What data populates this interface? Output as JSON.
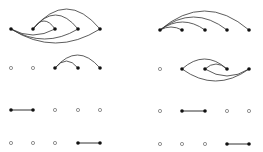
{
  "diagram": {
    "type": "arc-diagram-grid",
    "colors": {
      "edge": "#333333",
      "filled_node": "#111111",
      "hollow_node_stroke": "#777777",
      "background": "#ffffff"
    },
    "panels": [
      {
        "name": "left",
        "node_x": [
          11,
          33,
          55,
          78,
          100
        ],
        "rows": [
          {
            "y": 29,
            "nodes": [
              "filled",
              "filled",
              "filled",
              "filled",
              "filled"
            ],
            "arcs": [
              {
                "from": 1,
                "to": 2,
                "side": "above",
                "height": 8
              },
              {
                "from": 1,
                "to": 3,
                "side": "above",
                "height": 14
              },
              {
                "from": 1,
                "to": 4,
                "side": "above",
                "height": 20
              },
              {
                "from": 0,
                "to": 2,
                "side": "below",
                "height": 6
              },
              {
                "from": 0,
                "to": 3,
                "side": "below",
                "height": 10
              },
              {
                "from": 0,
                "to": 4,
                "side": "below",
                "height": 14
              }
            ],
            "lines": []
          },
          {
            "y": 68,
            "nodes": [
              "hollow",
              "hollow",
              "filled",
              "filled",
              "filled"
            ],
            "arcs": [
              {
                "from": 2,
                "to": 3,
                "side": "above",
                "height": 7
              },
              {
                "from": 2,
                "to": 4,
                "side": "above",
                "height": 13
              }
            ],
            "lines": []
          },
          {
            "y": 110,
            "nodes": [
              "filled",
              "filled",
              "hollow",
              "hollow",
              "hollow"
            ],
            "arcs": [],
            "lines": [
              {
                "from": 0,
                "to": 1
              }
            ]
          },
          {
            "y": 143,
            "nodes": [
              "hollow",
              "hollow",
              "hollow",
              "filled",
              "filled"
            ],
            "arcs": [],
            "lines": [
              {
                "from": 3,
                "to": 4
              }
            ]
          }
        ]
      },
      {
        "name": "right",
        "node_x": [
          160,
          182,
          205,
          227,
          249
        ],
        "rows": [
          {
            "y": 30,
            "nodes": [
              "filled",
              "filled",
              "filled",
              "filled",
              "filled"
            ],
            "arcs": [
              {
                "from": 0,
                "to": 1,
                "side": "above",
                "height": 3
              },
              {
                "from": 0,
                "to": 2,
                "side": "above",
                "height": 8
              },
              {
                "from": 0,
                "to": 3,
                "side": "above",
                "height": 13
              },
              {
                "from": 0,
                "to": 4,
                "side": "above",
                "height": 19
              }
            ],
            "lines": []
          },
          {
            "y": 69,
            "nodes": [
              "hollow",
              "filled",
              "filled",
              "filled",
              "filled"
            ],
            "arcs": [
              {
                "from": 1,
                "to": 3,
                "side": "above",
                "height": 10
              },
              {
                "from": 2,
                "to": 3,
                "side": "above",
                "height": 5
              },
              {
                "from": 1,
                "to": 4,
                "side": "below",
                "height": 12
              },
              {
                "from": 2,
                "to": 4,
                "side": "below",
                "height": 7
              }
            ],
            "lines": []
          },
          {
            "y": 111,
            "nodes": [
              "hollow",
              "filled",
              "filled",
              "hollow",
              "hollow"
            ],
            "arcs": [],
            "lines": [
              {
                "from": 1,
                "to": 2
              }
            ]
          },
          {
            "y": 144,
            "nodes": [
              "hollow",
              "hollow",
              "hollow",
              "filled",
              "filled"
            ],
            "arcs": [],
            "lines": [
              {
                "from": 3,
                "to": 4
              }
            ]
          }
        ]
      }
    ]
  }
}
